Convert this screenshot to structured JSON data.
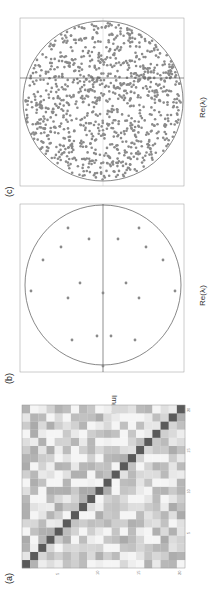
{
  "figure": {
    "orientation": "rotated 90 degrees clockwise",
    "panels": [
      {
        "id": "a",
        "label": "(a)",
        "kind": "matrix heatmap",
        "ticks": [
          "5",
          "10",
          "15",
          "20"
        ]
      },
      {
        "id": "b",
        "label": "(b)",
        "kind": "eigenvalue scatter",
        "xlabel": "Re(λ_i)",
        "ylabel": "Im(λ_i)"
      },
      {
        "id": "c",
        "label": "(c)",
        "kind": "eigenvalue scatter",
        "xlabel": "Re(λ_i)"
      }
    ]
  },
  "labels": {
    "a": "(a)",
    "b": "(b)",
    "c": "(c)",
    "re_b": "Re(λᵢ)",
    "re_c": "Re(λᵢ)",
    "im": "Im(λᵢ)"
  },
  "colors": {
    "point": "#8a8a8a",
    "axis": "#888888",
    "circle": "#555555",
    "diag": "#4a4a4a"
  },
  "chart_data": [
    {
      "type": "heatmap",
      "title": "(a)",
      "size": [
        20,
        20
      ],
      "xticks": [
        5,
        10,
        15,
        20
      ],
      "yticks": [
        5,
        10,
        15,
        20
      ],
      "note": "20x20 grayscale matrix, dark diagonal, random light-gray off-diagonal entries"
    },
    {
      "type": "scatter",
      "title": "(b)",
      "xlabel": "Re(λ_i)",
      "ylabel": "Im(λ_i)",
      "unit_circle": true,
      "n_points": 20,
      "points_page_coords": [
        [
          68,
          228
        ],
        [
          139,
          228
        ],
        [
          89,
          239
        ],
        [
          118,
          239
        ],
        [
          61,
          247
        ],
        [
          146,
          247
        ],
        [
          43,
          260
        ],
        [
          163,
          260
        ],
        [
          80,
          283
        ],
        [
          126,
          283
        ],
        [
          31,
          291
        ],
        [
          175,
          291
        ],
        [
          103,
          293
        ],
        [
          68,
          298
        ],
        [
          139,
          298
        ],
        [
          97,
          336
        ],
        [
          111,
          336
        ],
        [
          72,
          340
        ],
        [
          135,
          340
        ],
        [
          103,
          366
        ]
      ]
    },
    {
      "type": "scatter",
      "title": "(c)",
      "xlabel": "Re(λ_i)",
      "unit_circle": true,
      "n_points": "~1000 (uniformly filling disk)"
    }
  ]
}
